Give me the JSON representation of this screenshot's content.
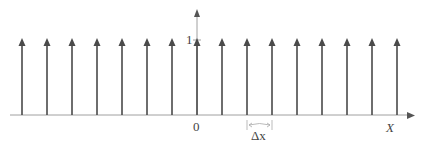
{
  "chart_data": {
    "type": "diagram",
    "impulse_positions": [
      -7,
      -6,
      -5,
      -4,
      -3,
      -2,
      -1,
      0,
      1,
      2,
      3,
      4,
      5,
      6,
      7,
      8
    ],
    "impulse_height": 1,
    "spacing_label": "Δx",
    "xlabel": "X",
    "origin_label": "0",
    "y_tick_label": "1"
  },
  "labels": {
    "one": "1",
    "zero": "0",
    "delta_x": "Δx",
    "x_axis": "X"
  },
  "colors": {
    "impulse": "#4a4a4a",
    "axis": "#9a9a9a",
    "text": "#444444"
  }
}
